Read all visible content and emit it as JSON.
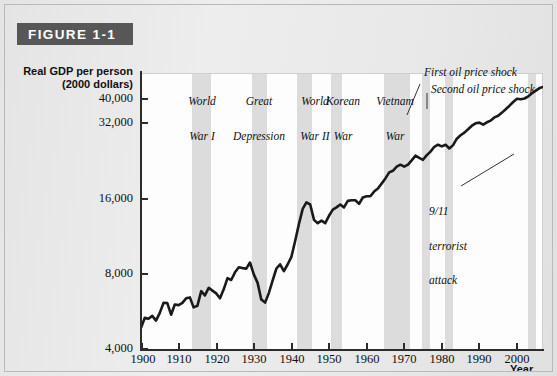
{
  "figure": {
    "banner_label": "FIGURE 1-1"
  },
  "axes": {
    "y_title_line1": "Real GDP per person",
    "y_title_line2": "(2000 dollars)",
    "x_title": "Year"
  },
  "chart_data": {
    "type": "line",
    "title": "FIGURE 1-1",
    "xlabel": "Year",
    "ylabel": "Real GDP per person (2000 dollars)",
    "yscale": "log",
    "ylim": [
      4000,
      44000
    ],
    "xlim": [
      1900,
      2007
    ],
    "grid": false,
    "legend": "none",
    "ytick_labels": [
      "4,000",
      "8,000",
      "16,000",
      "32,000",
      "40,000"
    ],
    "ytick_values": [
      4000,
      8000,
      16000,
      32000,
      40000
    ],
    "xtick_labels": [
      "1900",
      "1910",
      "1920",
      "1930",
      "1940",
      "1950",
      "1960",
      "1970",
      "1980",
      "1990",
      "2000"
    ],
    "xtick_values": [
      1900,
      1910,
      1920,
      1930,
      1940,
      1950,
      1960,
      1970,
      1980,
      1990,
      2000
    ],
    "series": [
      {
        "name": "Real GDP per person",
        "x": [
          1900,
          1901,
          1902,
          1903,
          1904,
          1905,
          1906,
          1907,
          1908,
          1909,
          1910,
          1911,
          1912,
          1913,
          1914,
          1915,
          1916,
          1917,
          1918,
          1919,
          1920,
          1921,
          1922,
          1923,
          1924,
          1925,
          1926,
          1927,
          1928,
          1929,
          1930,
          1931,
          1932,
          1933,
          1934,
          1935,
          1936,
          1937,
          1938,
          1939,
          1940,
          1941,
          1942,
          1943,
          1944,
          1945,
          1946,
          1947,
          1948,
          1949,
          1950,
          1951,
          1952,
          1953,
          1954,
          1955,
          1956,
          1957,
          1958,
          1959,
          1960,
          1961,
          1962,
          1963,
          1964,
          1965,
          1966,
          1967,
          1968,
          1969,
          1970,
          1971,
          1972,
          1973,
          1974,
          1975,
          1976,
          1977,
          1978,
          1979,
          1980,
          1981,
          1982,
          1983,
          1984,
          1985,
          1986,
          1987,
          1988,
          1989,
          1990,
          1991,
          1992,
          1993,
          1994,
          1995,
          1996,
          1997,
          1998,
          1999,
          2000,
          2001,
          2002,
          2003,
          2004,
          2005,
          2006,
          2007
        ],
        "y": [
          4900,
          5380,
          5330,
          5470,
          5240,
          5620,
          6170,
          6150,
          5530,
          6070,
          6040,
          6170,
          6430,
          6480,
          5910,
          6000,
          6860,
          6600,
          7080,
          6900,
          6720,
          6430,
          6980,
          7730,
          7600,
          8160,
          8550,
          8480,
          8440,
          8930,
          8000,
          7400,
          6350,
          6180,
          6740,
          7560,
          8450,
          8780,
          8240,
          8760,
          9400,
          10900,
          12700,
          14600,
          15500,
          15200,
          13200,
          12800,
          13100,
          12800,
          13700,
          14500,
          14800,
          15200,
          14800,
          15700,
          15800,
          15800,
          15300,
          16200,
          16400,
          16400,
          17100,
          17600,
          18400,
          19300,
          20400,
          20700,
          21500,
          21900,
          21500,
          21900,
          22800,
          23800,
          23300,
          22900,
          23900,
          24700,
          25800,
          26300,
          25900,
          26300,
          25400,
          26200,
          27800,
          28700,
          29400,
          30300,
          31300,
          32000,
          32200,
          31600,
          32300,
          32800,
          33800,
          34300,
          35300,
          36400,
          37600,
          38900,
          40100,
          39900,
          40200,
          41000,
          42200,
          43200,
          44200,
          44700
        ],
        "note": "approximate values read from the log-scale chart; line is a thick black curve"
      }
    ],
    "shaded_bands": [
      {
        "label": "World War I",
        "start": 1913,
        "end": 1918
      },
      {
        "label": "Great Depression",
        "start": 1929,
        "end": 1933
      },
      {
        "label": "World War II",
        "start": 1941,
        "end": 1945
      },
      {
        "label": "Korean War",
        "start": 1950,
        "end": 1953
      },
      {
        "label": "Vietnam War",
        "start": 1964,
        "end": 1971
      },
      {
        "label": "First oil price shock",
        "start": 1973,
        "end": 1975
      },
      {
        "label": "Second oil price shock",
        "start": 1979,
        "end": 1981
      },
      {
        "label": "9/11 terrorist attack",
        "start": 2001,
        "end": 2002
      }
    ],
    "annotations": [
      {
        "name": "world-war-i",
        "lines": [
          "World",
          "War I"
        ]
      },
      {
        "name": "great-depression",
        "lines": [
          "Great",
          "Depression"
        ]
      },
      {
        "name": "world-war-ii",
        "lines": [
          "World",
          "War II"
        ]
      },
      {
        "name": "korean-war",
        "lines": [
          "Korean",
          "War"
        ]
      },
      {
        "name": "vietnam-war",
        "lines": [
          "Vietnam",
          "War"
        ]
      },
      {
        "name": "first-oil-price-shock",
        "lines": [
          "First oil price shock"
        ]
      },
      {
        "name": "second-oil-price-shock",
        "lines": [
          "Second oil price shock"
        ]
      },
      {
        "name": "nine-eleven",
        "lines": [
          "9/11",
          "terrorist",
          "attack"
        ]
      }
    ]
  },
  "annotations": {
    "ww1_l1": "World",
    "ww1_l2": "War I",
    "gd_l1": "Great",
    "gd_l2": "Depression",
    "ww2_l1": "World",
    "ww2_l2": "War II",
    "korea_l1": "Korean",
    "korea_l2": "War",
    "vietnam_l1": "Vietnam",
    "vietnam_l2": "War",
    "oil1": "First oil price shock",
    "oil2": "Second oil price shock",
    "nine_l1": "9/11",
    "nine_l2": "terrorist",
    "nine_l3": "attack"
  },
  "colors": {
    "banner_bg": "#575757",
    "banner_text": "#ffffff",
    "band": "#dcdcdc",
    "line": "#1a1a1a",
    "page_bg": "#e9e9e9",
    "plot_bg": "#fdfdfd",
    "axis": "#2c2c2c"
  }
}
